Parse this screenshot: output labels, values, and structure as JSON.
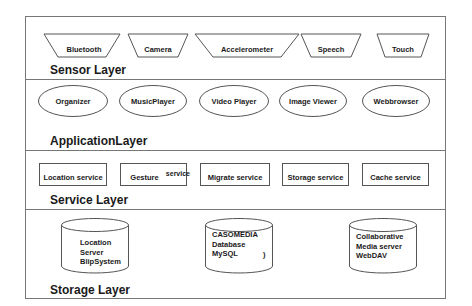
{
  "layers": [
    {
      "name": "sensor",
      "label": "Sensor Layer",
      "items": [
        {
          "label": "Bluetooth",
          "shape": "trapezoid"
        },
        {
          "label": "Camera",
          "shape": "trapezoid"
        },
        {
          "label": "Accelerometer",
          "shape": "trapezoid"
        },
        {
          "label": "Speech",
          "shape": "trapezoid"
        },
        {
          "label": "Touch",
          "shape": "trapezoid"
        }
      ]
    },
    {
      "name": "application",
      "label": "ApplicationLayer",
      "items": [
        {
          "label": "Organizer",
          "shape": "ellipse"
        },
        {
          "label": "MusicPlayer",
          "shape": "ellipse"
        },
        {
          "label": "Video  Player",
          "shape": "ellipse"
        },
        {
          "label": "Image Viewer",
          "shape": "ellipse"
        },
        {
          "label": "Webbrowser",
          "shape": "ellipse"
        }
      ]
    },
    {
      "name": "service",
      "label": "Service Layer",
      "items": [
        {
          "label": "Location service",
          "shape": "rectangle"
        },
        {
          "label": "Gesture",
          "label_extra": "service",
          "shape": "rectangle"
        },
        {
          "label": "Migrate  service",
          "shape": "rectangle"
        },
        {
          "label": "Storage  service",
          "shape": "rectangle"
        },
        {
          "label": "Cache  service",
          "shape": "rectangle"
        }
      ]
    },
    {
      "name": "storage",
      "label": "Storage Layer",
      "items": [
        {
          "lines": [
            "Location",
            "Server",
            "BlipSystem"
          ],
          "shape": "cylinder"
        },
        {
          "lines": [
            "CASOMEDIA",
            "Database",
            "MySQL"
          ],
          "extra_mark": ")",
          "shape": "cylinder"
        },
        {
          "lines": [
            "Collaborative",
            "Media server",
            "WebDAV"
          ],
          "shape": "cylinder"
        }
      ]
    }
  ],
  "colors": {
    "line": "#555555",
    "frame": "#777777",
    "text": "#1a1a1a",
    "background": "#ffffff"
  }
}
